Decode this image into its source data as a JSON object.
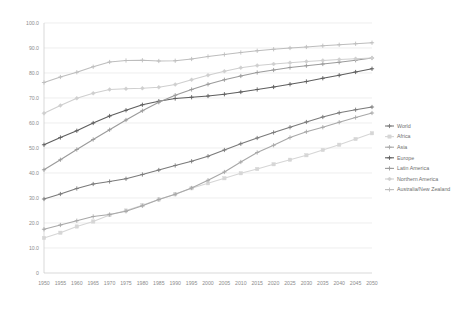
{
  "chart_data": {
    "type": "line",
    "title": "",
    "subtitle": "",
    "xlabel": "",
    "ylabel": "",
    "xlim": [
      1950,
      2050
    ],
    "ylim": [
      0,
      100
    ],
    "grid": true,
    "legend_position": "right",
    "x": [
      1950,
      1955,
      1960,
      1965,
      1970,
      1975,
      1980,
      1985,
      1990,
      1995,
      2000,
      2005,
      2010,
      2015,
      2020,
      2025,
      2030,
      2035,
      2040,
      2045,
      2050
    ],
    "categories": [
      "1950",
      "1955",
      "1960",
      "1965",
      "1970",
      "1975",
      "1980",
      "1985",
      "1990",
      "1995",
      "2000",
      "2005",
      "2010",
      "2015",
      "2020",
      "2025",
      "2030",
      "2035",
      "2040",
      "2045",
      "2050"
    ],
    "ytick_labels": [
      "0",
      "10.0",
      "20.0",
      "30.0",
      "40.0",
      "50.0",
      "60.0",
      "70.0",
      "80.0",
      "90.0",
      "100.0"
    ],
    "ytick_values": [
      0,
      10,
      20,
      30,
      40,
      50,
      60,
      70,
      80,
      90,
      100
    ],
    "series": [
      {
        "name": "World",
        "color": "#7a7a7a",
        "marker": "cross",
        "values": [
          29.6,
          31.6,
          33.8,
          35.6,
          36.6,
          37.7,
          39.4,
          41.2,
          43.0,
          44.7,
          46.7,
          49.2,
          51.7,
          54.0,
          56.2,
          58.3,
          60.4,
          62.4,
          64.1,
          65.3,
          66.4
        ]
      },
      {
        "name": "Africa",
        "color": "#d6d6d6",
        "marker": "square",
        "values": [
          14.0,
          16.1,
          18.6,
          20.6,
          23.2,
          25.0,
          27.1,
          29.4,
          31.5,
          33.9,
          35.9,
          37.9,
          39.9,
          41.6,
          43.5,
          45.3,
          47.1,
          49.2,
          51.3,
          53.6,
          55.9
        ]
      },
      {
        "name": "Asia",
        "color": "#a8a8a8",
        "marker": "cross",
        "values": [
          17.5,
          19.2,
          20.9,
          22.6,
          23.4,
          24.7,
          26.9,
          29.4,
          31.5,
          34.0,
          37.1,
          40.4,
          44.4,
          48.2,
          51.1,
          54.2,
          56.5,
          58.3,
          60.3,
          62.2,
          64.0
        ]
      },
      {
        "name": "Europe",
        "color": "#5e5e5e",
        "marker": "cross",
        "values": [
          51.3,
          54.2,
          56.9,
          60.0,
          62.8,
          65.1,
          67.3,
          68.7,
          69.8,
          70.3,
          70.8,
          71.5,
          72.4,
          73.4,
          74.4,
          75.5,
          76.6,
          77.9,
          79.1,
          80.4,
          81.7
        ]
      },
      {
        "name": "Latin America",
        "color": "#9b9b9b",
        "marker": "cross",
        "values": [
          41.3,
          45.3,
          49.4,
          53.4,
          57.3,
          61.2,
          64.9,
          68.3,
          71.1,
          73.4,
          75.5,
          77.3,
          78.8,
          80.2,
          81.2,
          82.2,
          82.9,
          83.6,
          84.3,
          85.1,
          86.0
        ]
      },
      {
        "name": "Northern America",
        "color": "#cfcfcf",
        "marker": "diamond",
        "values": [
          63.9,
          67.0,
          69.9,
          71.9,
          73.4,
          73.7,
          73.9,
          74.3,
          75.4,
          77.3,
          79.1,
          80.7,
          82.1,
          83.0,
          83.6,
          84.1,
          84.6,
          85.0,
          85.4,
          85.7,
          86.0
        ]
      },
      {
        "name": "Australia/New Zealand",
        "color": "#bdbdbd",
        "marker": "cross",
        "values": [
          76.2,
          78.4,
          80.3,
          82.5,
          84.4,
          85.0,
          85.1,
          84.8,
          84.9,
          85.6,
          86.6,
          87.4,
          88.2,
          88.9,
          89.5,
          90.0,
          90.4,
          90.9,
          91.3,
          91.7,
          92.1
        ]
      }
    ]
  },
  "legend": {
    "items": [
      {
        "label": "World"
      },
      {
        "label": "Africa"
      },
      {
        "label": "Asia"
      },
      {
        "label": "Europe"
      },
      {
        "label": "Latin America"
      },
      {
        "label": "Northern America"
      },
      {
        "label": "Australia/New Zealand"
      }
    ]
  }
}
